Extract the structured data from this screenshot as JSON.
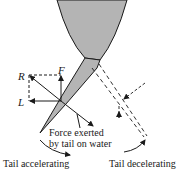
{
  "diagram": {
    "vector_labels": {
      "resultant": "R",
      "forward": "F",
      "lateral": "L"
    },
    "annotation": {
      "line1": "Force exerted",
      "line2": "by tail on water"
    },
    "captions": {
      "left": "Tail accelerating",
      "right": "Tail decelerating"
    },
    "colors": {
      "body_fill": "#b4b4b4",
      "ink": "#1a1a1a"
    }
  }
}
